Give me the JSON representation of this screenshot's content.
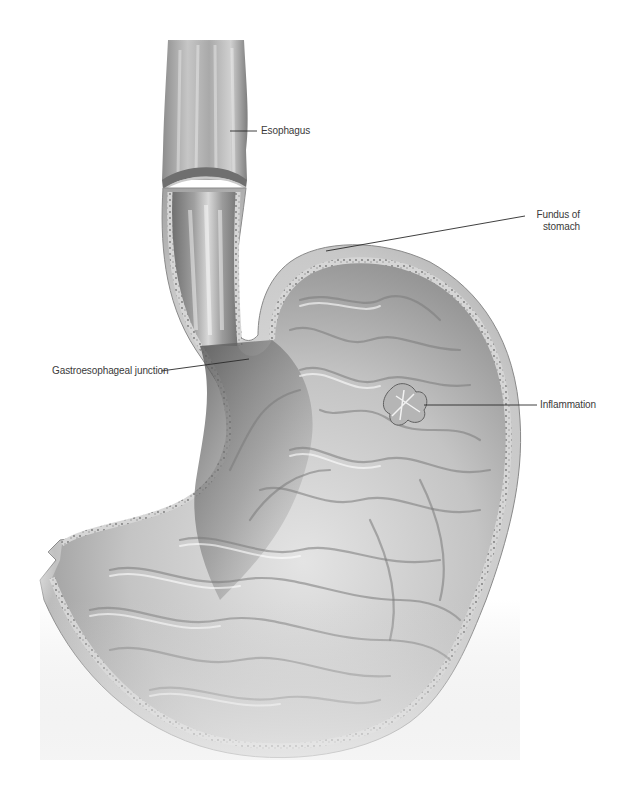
{
  "figure": {
    "type": "anatomical-illustration",
    "colors": {
      "background": "#ffffff",
      "label_text": "#3a3a3a",
      "leader_line": "#2a2a2a",
      "outer_wall": "#cfcfcf",
      "wall_dark": "#8a8a8a",
      "mucosa_light": "#e2e2e2",
      "mucosa_dark": "#6e6e6e"
    }
  },
  "labels": {
    "esophagus": {
      "text": "Esophagus",
      "x": 261,
      "y": 126,
      "line": [
        230,
        131,
        257,
        131
      ]
    },
    "fundus": {
      "line1": "Fundus of",
      "line2": "stomach",
      "x": 530,
      "y": 210,
      "line": [
        326,
        251,
        525,
        216
      ]
    },
    "ge_junction": {
      "text": "Gastroesophageal junction",
      "x": 52,
      "y": 366,
      "line": [
        161,
        371,
        249,
        359
      ]
    },
    "inflammation": {
      "text": "Inflammation",
      "x": 540,
      "y": 400,
      "line": [
        424,
        405,
        537,
        405
      ]
    }
  }
}
